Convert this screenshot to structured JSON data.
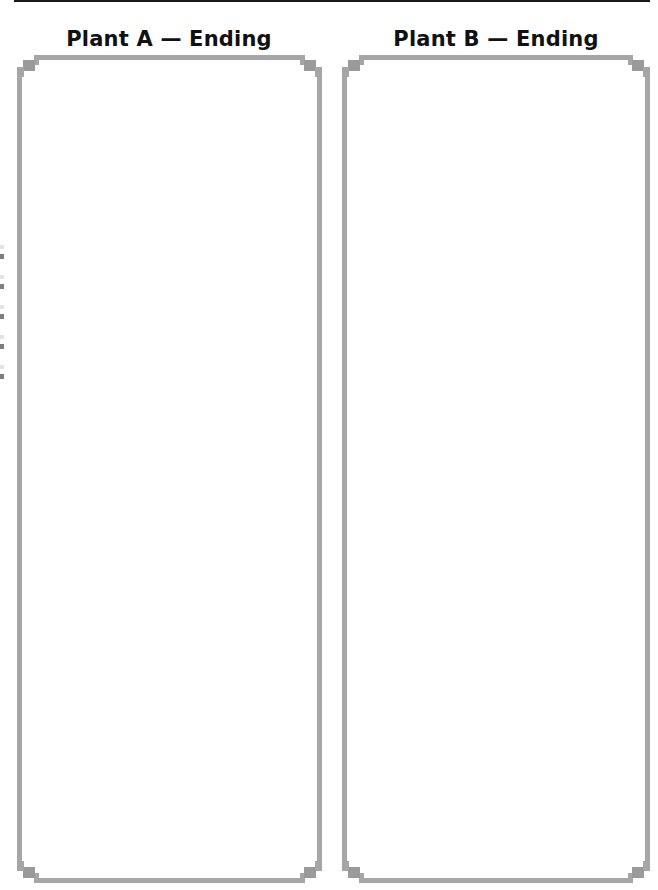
{
  "page": {
    "panels": [
      {
        "title": "Plant A — Ending",
        "content": ""
      },
      {
        "title": "Plant B — Ending",
        "content": ""
      }
    ],
    "colors": {
      "frame_border": "#a6a6a6",
      "title_text": "#111111",
      "top_rule": "#1a1a1a"
    }
  }
}
